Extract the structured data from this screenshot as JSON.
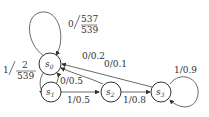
{
  "diagram": {
    "type": "state-transition",
    "states": [
      {
        "id": "s0",
        "label": "s",
        "sub": "0"
      },
      {
        "id": "s1",
        "label": "s",
        "sub": "1"
      },
      {
        "id": "s2",
        "label": "s",
        "sub": "2"
      },
      {
        "id": "s3",
        "label": "s",
        "sub": "3"
      }
    ],
    "transitions": [
      {
        "from": "s0",
        "to": "s0",
        "input": "0",
        "num": "537",
        "den": "539",
        "label": "0/537/539"
      },
      {
        "from": "s0",
        "to": "s1",
        "input": "1",
        "num": "2",
        "den": "539",
        "label": "1/2/539"
      },
      {
        "from": "s1",
        "to": "s0",
        "label": "0/0.5"
      },
      {
        "from": "s1",
        "to": "s2",
        "label": "1/0.5"
      },
      {
        "from": "s2",
        "to": "s0",
        "label": "0/0.2"
      },
      {
        "from": "s2",
        "to": "s3",
        "label": "1/0.8"
      },
      {
        "from": "s3",
        "to": "s0",
        "label": "0/0.1"
      },
      {
        "from": "s3",
        "to": "s3",
        "label": "1/0.9"
      }
    ]
  }
}
